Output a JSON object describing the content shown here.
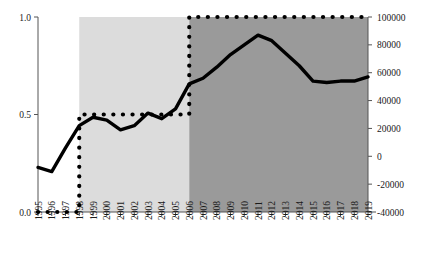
{
  "chart_data": {
    "type": "line",
    "title": "",
    "xlabel": "",
    "ylabel_left": "",
    "ylabel_right": "",
    "grid": false,
    "legend": "none",
    "x": [
      1995,
      1996,
      1997,
      1998,
      1999,
      2000,
      2001,
      2002,
      2003,
      2004,
      2005,
      2006,
      2007,
      2008,
      2009,
      2010,
      2011,
      2012,
      2013,
      2014,
      2015,
      2016,
      2017,
      2018,
      2019
    ],
    "xtick_labels": [
      "1995",
      "1996",
      "1997",
      "1998",
      "1999",
      "2000",
      "2001",
      "2002",
      "2003",
      "2004",
      "2005",
      "2006",
      "2007",
      "2008",
      "2009",
      "2010",
      "2011",
      "2012",
      "2013",
      "2014",
      "2015",
      "2016",
      "2017",
      "2018",
      "2019"
    ],
    "xlim": [
      1995,
      2019
    ],
    "left_axis": {
      "ylim": [
        0.0,
        1.0
      ],
      "ticks": [
        0.0,
        0.5,
        1.0
      ],
      "tick_labels": [
        "0.0",
        "0.5",
        "1.0"
      ]
    },
    "right_axis": {
      "ylim": [
        -40000,
        100000
      ],
      "ticks": [
        -40000,
        -20000,
        0,
        20000,
        40000,
        60000,
        80000,
        100000
      ],
      "tick_labels": [
        "-40000",
        "-20000",
        "0",
        "20000",
        "40000",
        "60000",
        "80000",
        "100000"
      ]
    },
    "series": [
      {
        "name": "solid-line",
        "axis": "right",
        "style": "solid",
        "color": "#000000",
        "values": [
          -8000,
          -11000,
          6000,
          22000,
          28000,
          26000,
          19000,
          22000,
          31000,
          27000,
          34000,
          52000,
          56000,
          64000,
          73000,
          80000,
          87000,
          83000,
          74000,
          65000,
          54000,
          53000,
          54000,
          54000,
          57000
        ]
      },
      {
        "name": "dotted-line",
        "axis": "left",
        "style": "dotted",
        "color": "#000000",
        "values": [
          0.0,
          0.0,
          0.0,
          0.5,
          0.5,
          0.5,
          0.5,
          0.5,
          0.5,
          0.5,
          0.5,
          1.0,
          1.0,
          1.0,
          1.0,
          1.0,
          1.0,
          1.0,
          1.0,
          1.0,
          1.0,
          1.0,
          1.0,
          1.0,
          1.0
        ]
      }
    ],
    "shaded_regions": [
      {
        "name": "light-band",
        "x_start": 1998,
        "x_end": 2006,
        "color": "#dcdcdc"
      },
      {
        "name": "dark-band",
        "x_start": 2006,
        "x_end": 2019,
        "color": "#9a9a9a"
      }
    ]
  },
  "colors": {
    "light_band": "#dcdcdc",
    "dark_band": "#9a9a9a",
    "line": "#000000",
    "axis": "#555555",
    "text": "#1a1a1a",
    "background": "#ffffff"
  }
}
